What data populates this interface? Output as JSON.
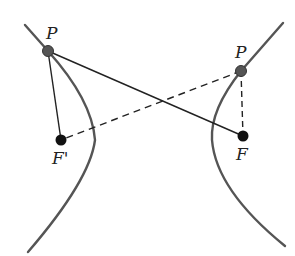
{
  "diagram": {
    "colors": {
      "curve": "#555555",
      "line": "#222222",
      "point_p": "#555555",
      "focus": "#111111",
      "background": "#ffffff"
    },
    "labels": {
      "p_left": "P",
      "p_right": "P",
      "f_prime": "F'",
      "f": "F"
    },
    "points": {
      "p_left": {
        "x": 48,
        "y": 51
      },
      "p_right": {
        "x": 241,
        "y": 71
      },
      "f_prime": {
        "x": 61,
        "y": 140
      },
      "f": {
        "x": 243,
        "y": 136
      }
    },
    "segments": [
      {
        "from": "p_left",
        "to": "f_prime",
        "style": "solid"
      },
      {
        "from": "p_left",
        "to": "f",
        "style": "solid"
      },
      {
        "from": "p_right",
        "to": "f_prime",
        "style": "dashed"
      },
      {
        "from": "p_right",
        "to": "f",
        "style": "dashed"
      }
    ],
    "branches": [
      "left",
      "right"
    ]
  }
}
